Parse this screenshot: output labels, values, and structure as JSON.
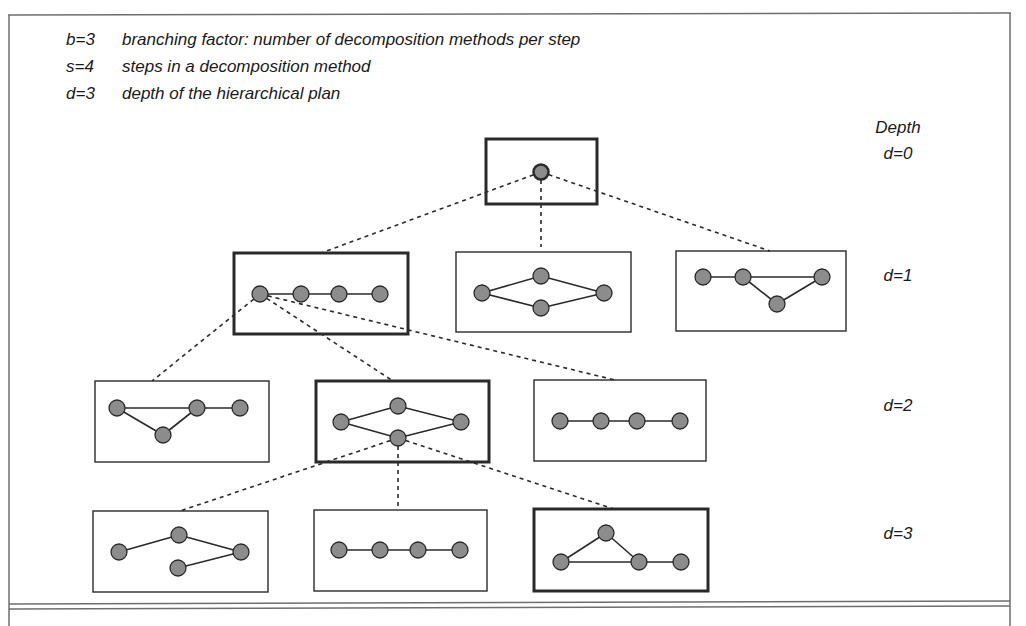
{
  "legend": [
    {
      "key": "b=3",
      "text": "branching factor: number of decomposition methods per step"
    },
    {
      "key": "s=4",
      "text": "steps in a decomposition method"
    },
    {
      "key": "d=3",
      "text": "depth of the hierarchical plan"
    }
  ],
  "depth_header": "Depth",
  "depth_labels": [
    "d=0",
    "d=1",
    "d=2",
    "d=3"
  ],
  "colors": {
    "node_fill": "#8c8c8c",
    "node_stroke": "#2a2a2a",
    "line": "#2a2a2a",
    "frame": "#6e6e6e"
  },
  "boxes": [
    {
      "id": "root",
      "depth": 0,
      "x": 486,
      "y": 139,
      "w": 111,
      "h": 65,
      "selected": true,
      "nodes": [
        [
          541,
          172
        ]
      ],
      "edges": []
    },
    {
      "id": "d1-a",
      "depth": 1,
      "x": 234,
      "y": 253,
      "w": 174,
      "h": 81,
      "selected": true,
      "nodes": [
        [
          260,
          294
        ],
        [
          301,
          294
        ],
        [
          339,
          294
        ],
        [
          380,
          294
        ]
      ],
      "edges": [
        [
          0,
          1
        ],
        [
          1,
          2
        ],
        [
          2,
          3
        ]
      ]
    },
    {
      "id": "d1-b",
      "depth": 1,
      "x": 456,
      "y": 252,
      "w": 175,
      "h": 80,
      "selected": false,
      "nodes": [
        [
          482,
          293
        ],
        [
          541,
          276
        ],
        [
          541,
          308
        ],
        [
          604,
          293
        ]
      ],
      "edges": [
        [
          0,
          1
        ],
        [
          0,
          2
        ],
        [
          1,
          3
        ],
        [
          2,
          3
        ]
      ]
    },
    {
      "id": "d1-c",
      "depth": 1,
      "x": 676,
      "y": 251,
      "w": 170,
      "h": 80,
      "selected": false,
      "nodes": [
        [
          703,
          277
        ],
        [
          743,
          277
        ],
        [
          822,
          277
        ],
        [
          777,
          304
        ]
      ],
      "edges": [
        [
          0,
          1
        ],
        [
          1,
          2
        ],
        [
          1,
          3
        ],
        [
          3,
          2
        ]
      ]
    },
    {
      "id": "d2-a",
      "depth": 2,
      "x": 95,
      "y": 381,
      "w": 174,
      "h": 81,
      "selected": false,
      "nodes": [
        [
          117,
          408
        ],
        [
          163,
          435
        ],
        [
          197,
          408
        ],
        [
          240,
          408
        ]
      ],
      "edges": [
        [
          0,
          2
        ],
        [
          0,
          1
        ],
        [
          1,
          2
        ],
        [
          2,
          3
        ]
      ]
    },
    {
      "id": "d2-b",
      "depth": 2,
      "x": 316,
      "y": 381,
      "w": 173,
      "h": 81,
      "selected": true,
      "nodes": [
        [
          341,
          422
        ],
        [
          398,
          406
        ],
        [
          398,
          438
        ],
        [
          461,
          422
        ]
      ],
      "edges": [
        [
          0,
          1
        ],
        [
          0,
          2
        ],
        [
          1,
          3
        ],
        [
          2,
          3
        ]
      ]
    },
    {
      "id": "d2-c",
      "depth": 2,
      "x": 534,
      "y": 380,
      "w": 172,
      "h": 81,
      "selected": false,
      "nodes": [
        [
          560,
          421
        ],
        [
          601,
          421
        ],
        [
          637,
          421
        ],
        [
          680,
          421
        ]
      ],
      "edges": [
        [
          0,
          1
        ],
        [
          1,
          2
        ],
        [
          2,
          3
        ]
      ]
    },
    {
      "id": "d3-a",
      "depth": 3,
      "x": 93,
      "y": 511,
      "w": 175,
      "h": 81,
      "selected": false,
      "nodes": [
        [
          119,
          552
        ],
        [
          179,
          535
        ],
        [
          241,
          552
        ],
        [
          178,
          568
        ]
      ],
      "edges": [
        [
          0,
          1
        ],
        [
          1,
          2
        ],
        [
          3,
          2
        ]
      ]
    },
    {
      "id": "d3-b",
      "depth": 3,
      "x": 314,
      "y": 510,
      "w": 173,
      "h": 81,
      "selected": false,
      "nodes": [
        [
          339,
          550
        ],
        [
          380,
          550
        ],
        [
          418,
          550
        ],
        [
          460,
          550
        ]
      ],
      "edges": [
        [
          0,
          1
        ],
        [
          1,
          2
        ],
        [
          2,
          3
        ]
      ]
    },
    {
      "id": "d3-c",
      "depth": 3,
      "x": 534,
      "y": 509,
      "w": 174,
      "h": 82,
      "selected": true,
      "nodes": [
        [
          561,
          562
        ],
        [
          606,
          533
        ],
        [
          639,
          562
        ],
        [
          681,
          562
        ]
      ],
      "edges": [
        [
          0,
          1
        ],
        [
          1,
          2
        ],
        [
          0,
          2
        ],
        [
          2,
          3
        ]
      ]
    }
  ],
  "dashed_links": [
    {
      "from": [
        541,
        172
      ],
      "to": [
        321,
        253
      ]
    },
    {
      "from": [
        541,
        172
      ],
      "to": [
        541,
        247
      ]
    },
    {
      "from": [
        541,
        172
      ],
      "to": [
        770,
        251
      ]
    },
    {
      "from": [
        260,
        294
      ],
      "to": [
        152,
        381
      ]
    },
    {
      "from": [
        260,
        294
      ],
      "to": [
        393,
        381
      ]
    },
    {
      "from": [
        260,
        294
      ],
      "to": [
        615,
        380
      ]
    },
    {
      "from": [
        398,
        438
      ],
      "to": [
        180,
        511
      ]
    },
    {
      "from": [
        398,
        438
      ],
      "to": [
        398,
        510
      ]
    },
    {
      "from": [
        398,
        438
      ],
      "to": [
        614,
        509
      ]
    }
  ]
}
